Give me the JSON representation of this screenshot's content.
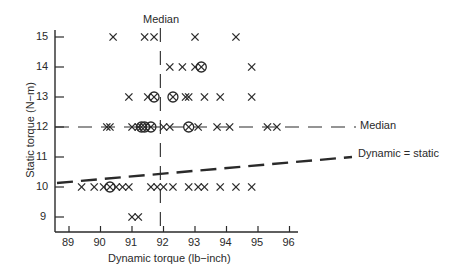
{
  "chart_data": {
    "type": "scatter",
    "title": "",
    "xlabel": "Dynamic torque (lb−inch)",
    "ylabel": "Static torque (N−m)",
    "xlim": [
      88.6,
      96.3
    ],
    "ylim": [
      8.5,
      15.5
    ],
    "xticks": [
      89,
      90,
      91,
      92,
      93,
      94,
      95,
      96
    ],
    "yticks": [
      9,
      10,
      11,
      12,
      13,
      14,
      15
    ],
    "grid": false,
    "legend": null,
    "series": [
      {
        "name": "single observation",
        "marker": "x",
        "points": [
          [
            90.4,
            15
          ],
          [
            91.4,
            15
          ],
          [
            91.7,
            15
          ],
          [
            93.0,
            15
          ],
          [
            94.3,
            15
          ],
          [
            92.2,
            14
          ],
          [
            92.6,
            14
          ],
          [
            93.0,
            14
          ],
          [
            94.8,
            14
          ],
          [
            90.9,
            13
          ],
          [
            91.5,
            13
          ],
          [
            92.7,
            13
          ],
          [
            92.8,
            13
          ],
          [
            93.3,
            13
          ],
          [
            93.8,
            13
          ],
          [
            94.8,
            13
          ],
          [
            90.2,
            12
          ],
          [
            90.3,
            12
          ],
          [
            91.0,
            12
          ],
          [
            91.2,
            12
          ],
          [
            92.0,
            12
          ],
          [
            92.2,
            12
          ],
          [
            93.1,
            12
          ],
          [
            93.7,
            12
          ],
          [
            94.1,
            12
          ],
          [
            95.3,
            12
          ],
          [
            95.6,
            12
          ],
          [
            89.4,
            10
          ],
          [
            89.8,
            10
          ],
          [
            90.1,
            10
          ],
          [
            90.5,
            10
          ],
          [
            90.7,
            10
          ],
          [
            90.9,
            10
          ],
          [
            91.6,
            10
          ],
          [
            91.8,
            10
          ],
          [
            92.0,
            10
          ],
          [
            92.3,
            10
          ],
          [
            92.8,
            10
          ],
          [
            93.1,
            10
          ],
          [
            93.3,
            10
          ],
          [
            93.8,
            10
          ],
          [
            94.3,
            10
          ],
          [
            94.8,
            10
          ],
          [
            91.0,
            9
          ],
          [
            91.2,
            9
          ]
        ]
      },
      {
        "name": "repeated observation",
        "marker": "circled-x",
        "points": [
          [
            93.2,
            14
          ],
          [
            91.7,
            13
          ],
          [
            92.3,
            13
          ],
          [
            91.3,
            12
          ],
          [
            91.4,
            12
          ],
          [
            91.6,
            12
          ],
          [
            92.8,
            12
          ],
          [
            90.3,
            10
          ]
        ]
      }
    ],
    "reference_lines": [
      {
        "name": "Median (dynamic)",
        "orientation": "vertical",
        "x": 91.9,
        "style": "dashed",
        "label": "Median"
      },
      {
        "name": "Median (static)",
        "orientation": "horizontal",
        "y": 12,
        "style": "dashed",
        "label": "Median"
      },
      {
        "name": "Dynamic = static",
        "orientation": "diagonal",
        "from": [
          88.6,
          10.1
        ],
        "to": [
          96.3,
          11.1
        ],
        "style": "heavy-dashed",
        "label": "Dynamic = static"
      }
    ]
  },
  "labels": {
    "median_top": "Median",
    "median_right": "Median",
    "dynamic_static": "Dynamic = static",
    "xlabel": "Dynamic torque (lb−inch)",
    "ylabel": "Static torque (N−m)"
  },
  "colors": {
    "ink": "#2a2a2a",
    "background": "#ffffff"
  }
}
